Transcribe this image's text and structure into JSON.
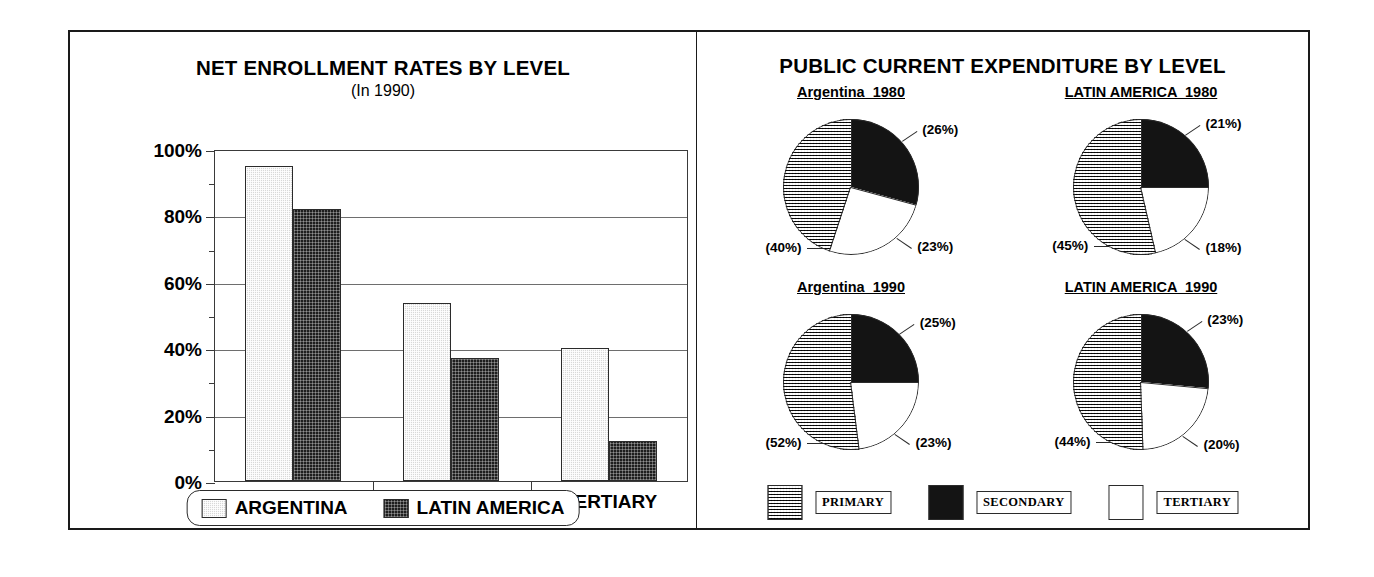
{
  "figure": {
    "panels": [
      {
        "name": "net-enrollment",
        "title": "NET ENROLLMENT RATES BY LEVEL",
        "subtitle": "(In 1990)"
      },
      {
        "name": "public-expenditure",
        "title": "PUBLIC CURRENT EXPENDITURE BY LEVEL"
      }
    ]
  },
  "chart_data": [
    {
      "type": "bar",
      "title": "NET ENROLLMENT RATES BY LEVEL",
      "subtitle": "(In 1990)",
      "xlabel": "",
      "ylabel": "",
      "ylim": [
        0,
        100
      ],
      "ytick_labels": [
        "0%",
        "20%",
        "40%",
        "60%",
        "80%",
        "100%"
      ],
      "ytick_values": [
        0,
        20,
        40,
        60,
        80,
        100
      ],
      "minor_tick_values": [
        10,
        30,
        50,
        70,
        90
      ],
      "grid": true,
      "legend_position": "bottom",
      "categories": [
        "PRIMARY",
        "SECONDARY",
        "TERTIARY"
      ],
      "series": [
        {
          "name": "ARGENTINA",
          "values": [
            95,
            53.5,
            40
          ],
          "fill": "light-stipple"
        },
        {
          "name": "LATIN AMERICA",
          "values": [
            82,
            37,
            12
          ],
          "fill": "dark-crosshatch"
        }
      ]
    },
    {
      "type": "pie",
      "title": "PUBLIC CURRENT EXPENDITURE BY LEVEL",
      "legend_position": "bottom",
      "legend": [
        {
          "label": "PRIMARY",
          "fill": "grid-crosshatch"
        },
        {
          "label": "SECONDARY",
          "fill": "black"
        },
        {
          "label": "TERTIARY",
          "fill": "white"
        }
      ],
      "pies": [
        {
          "caption": "Argentina  1980",
          "slices": [
            {
              "label": "SECONDARY",
              "value": 26,
              "text": "(26%)",
              "fill": "black"
            },
            {
              "label": "TERTIARY",
              "value": 23,
              "text": "(23%)",
              "fill": "white"
            },
            {
              "label": "PRIMARY",
              "value": 40,
              "text": "(40%)",
              "fill": "grid-crosshatch"
            }
          ]
        },
        {
          "caption": "LATIN AMERICA  1980",
          "slices": [
            {
              "label": "SECONDARY",
              "value": 21,
              "text": "(21%)",
              "fill": "black"
            },
            {
              "label": "TERTIARY",
              "value": 18,
              "text": "(18%)",
              "fill": "white"
            },
            {
              "label": "PRIMARY",
              "value": 45,
              "text": "(45%)",
              "fill": "grid-crosshatch"
            }
          ]
        },
        {
          "caption": "Argentina  1990",
          "slices": [
            {
              "label": "SECONDARY",
              "value": 25,
              "text": "(25%)",
              "fill": "black"
            },
            {
              "label": "TERTIARY",
              "value": 23,
              "text": "(23%)",
              "fill": "white"
            },
            {
              "label": "PRIMARY",
              "value": 52,
              "text": "(52%)",
              "fill": "grid-crosshatch"
            }
          ]
        },
        {
          "caption": "LATIN AMERICA  1990",
          "slices": [
            {
              "label": "SECONDARY",
              "value": 23,
              "text": "(23%)",
              "fill": "black"
            },
            {
              "label": "TERTIARY",
              "value": 20,
              "text": "(20%)",
              "fill": "white"
            },
            {
              "label": "PRIMARY",
              "value": 44,
              "text": "(44%)",
              "fill": "grid-crosshatch"
            }
          ]
        }
      ]
    }
  ],
  "colors": {
    "ink": "#1a1a1a",
    "grid": "#6e6e6e",
    "light_fill": "#d8d8d8",
    "dark_fill": "#1e1e1e",
    "mid_fill": "#8a8a8a",
    "white_fill": "#ffffff"
  }
}
